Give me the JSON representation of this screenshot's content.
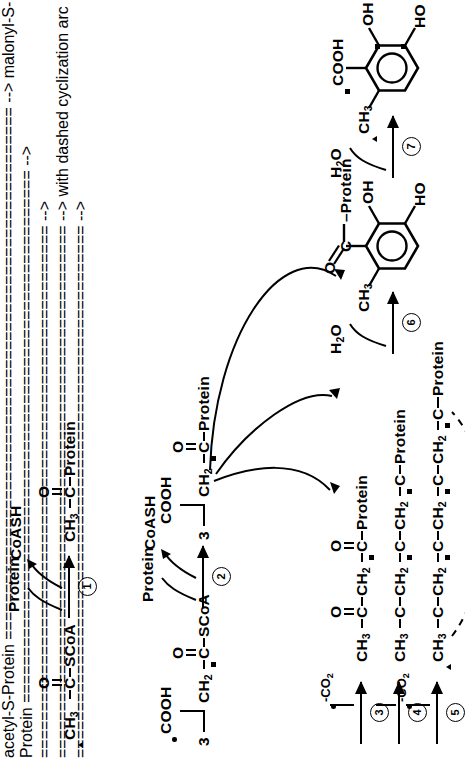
{
  "figure": {
    "kind": "biosynthetic-reaction-scheme",
    "orientation": "page rotated 90 degrees counter-clockwise"
  },
  "legend": {
    "markers": [
      {
        "symbol": "triangle",
        "name": "filled-triangle-label"
      },
      {
        "symbol": "dot",
        "name": "filled-circle-label"
      },
      {
        "symbol": "square",
        "name": "filled-square-label"
      }
    ]
  },
  "steps": [
    {
      "id": "1",
      "number": "1",
      "reagent_in": "Protein",
      "reagent_out": "CoASH"
    },
    {
      "id": "2",
      "number": "2",
      "reagent_in": "Protein",
      "reagent_out": "CoASH"
    },
    {
      "id": "3",
      "number": "3",
      "reagent_out": "-CO",
      "reagent_out_sub": "2"
    },
    {
      "id": "4",
      "number": "4",
      "reagent_out": "-CO",
      "reagent_out_sub": "2"
    },
    {
      "id": "5",
      "number": "5",
      "reagent_out": "-CO",
      "reagent_out_sub": "2"
    },
    {
      "id": "6",
      "number": "6",
      "reagent_out": "H",
      "reagent_out_sub": "2",
      "reagent_out_tail": "O"
    },
    {
      "id": "7",
      "number": "7",
      "reagent_out": "H",
      "reagent_out_sub": "2",
      "reagent_out_tail": "O"
    }
  ],
  "species": {
    "acetyl_coa": {
      "label": "acetyl-CoA",
      "left": "CH",
      "left_sub": "3",
      "carbonyl": "C",
      "oxygen": "O",
      "right": "SCoA"
    },
    "acetyl_protein": {
      "label": "acetyl-S-protein",
      "left": "CH",
      "left_sub": "3",
      "carbonyl": "C",
      "oxygen": "O",
      "right": "Protein"
    },
    "malonyl_coa": {
      "label": "malonyl-CoA",
      "count": "3",
      "acid": "COOH",
      "methylene": "CH",
      "methylene_sub": "2",
      "carbonyl": "C",
      "oxygen": "O",
      "right": "SCoA"
    },
    "malonyl_protein": {
      "label": "malonyl-S-protein",
      "count": "3",
      "acid": "COOH",
      "methylene": "CH",
      "methylene_sub": "2",
      "carbonyl": "C",
      "oxygen": "O",
      "right": "Protein"
    },
    "diketide": {
      "label": "acetoacetyl-S-protein (diketide)",
      "terminal": "CH",
      "terminal_sub": "3",
      "units": [
        "C",
        "CH",
        "C"
      ],
      "right": "Protein"
    },
    "triketide": {
      "label": "triketide-S-protein",
      "terminal": "CH",
      "terminal_sub": "3",
      "right": "Protein"
    },
    "tetraketide": {
      "label": "tetraketide-S-protein",
      "terminal": "CH",
      "terminal_sub": "3",
      "right": "Protein"
    },
    "aryl_protein": {
      "label": "orsellinyl-S-protein",
      "methyl": "CH",
      "methyl_sub": "3",
      "carbonyl": "C",
      "oxygen": "O",
      "thioester": "Protein",
      "oh_right": "OH",
      "ho_left": "HO"
    },
    "orsellinic_acid": {
      "label": "orsellinic acid",
      "methyl": "CH",
      "methyl_sub": "3",
      "acid": "COOH",
      "oh_right": "OH",
      "ho_left": "HO"
    }
  },
  "text": {
    "protein": "Protein",
    "coash": "CoASH",
    "water": "H",
    "water_sub": "2",
    "water_tail": "O",
    "co2": "-CO",
    "co2_sub": "2",
    "scoa": "SCoA",
    "cooh": "COOH",
    "oh": "OH",
    "ho": "HO",
    "c": "C",
    "o": "O",
    "ch": "CH",
    "sub2": "2",
    "sub3": "3",
    "three": "3",
    "dash": "–"
  }
}
